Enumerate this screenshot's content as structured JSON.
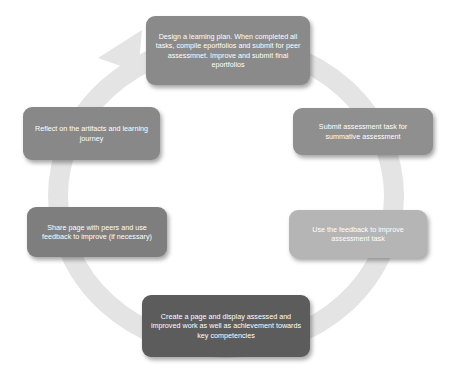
{
  "diagram": {
    "type": "cycle",
    "ring_color": "#e4e4e4",
    "steps": [
      {
        "id": "design",
        "text": "Design a learning plan.  When completed all tasks, compile eportfolios and submit for peer assessmnet. Improve and submit final eportfolios",
        "color": "#8a8a8a"
      },
      {
        "id": "submit",
        "text": "Submit assessment task for summative assessment",
        "color": "#8f8f8f"
      },
      {
        "id": "feedback",
        "text": "Use the feedback to improve assessment task",
        "color": "#b5b5b5"
      },
      {
        "id": "create",
        "text": "Create a page and display assessed and improved work as well as achievement towards key competencies",
        "color": "#5c5c5c"
      },
      {
        "id": "share",
        "text": "Share page with peers and use feedback to improve (if necessary)",
        "color": "#7e7e7e"
      },
      {
        "id": "reflect",
        "text": "Reflect on the artifacts and learning journey",
        "color": "#888888"
      }
    ]
  }
}
